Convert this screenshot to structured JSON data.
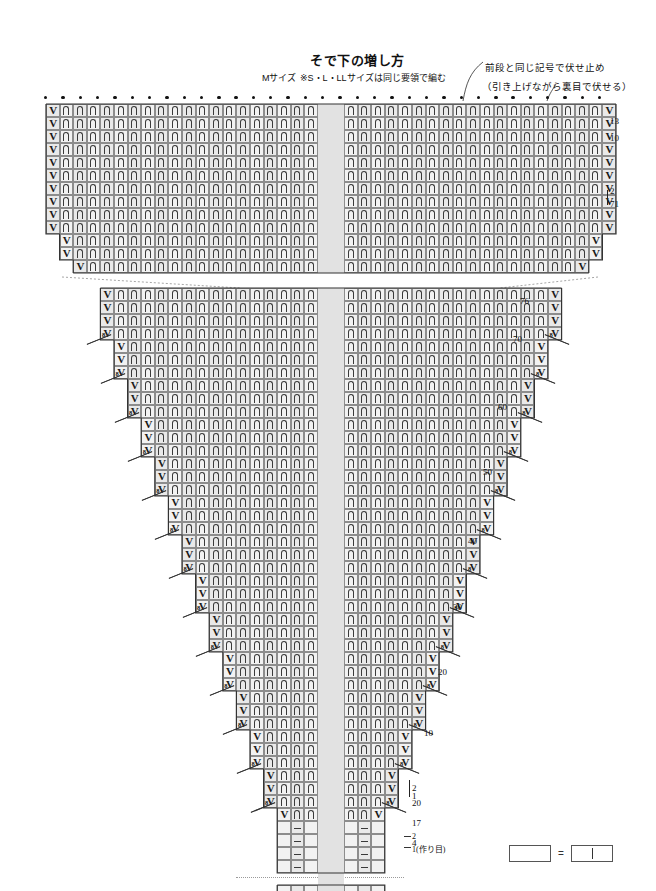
{
  "page": {
    "title": "そで下の増し方",
    "size_label": "Mサイズ",
    "size_note": "※S・L・LLサイズは同じ要領で編む",
    "annotation_1": "前段と同じ記号で伏せ止め",
    "annotation_2": "（引き上げながら裏目で伏せる）"
  },
  "legend": {
    "empty_label": "",
    "equals": "=",
    "knit_label": "",
    "meaning": "空白マス = 表目（knit）"
  },
  "symbols": {
    "increase": "V",
    "twisted_knit": "arch-symbol",
    "purl": "purl-bar",
    "bind_off": "bind-off-dot",
    "every_8_rows": "8"
  },
  "chart_data": {
    "type": "table",
    "top_section": {
      "label": "upper sleeve cap",
      "row_labels": [
        "13",
        "10",
        "2",
        "71"
      ],
      "bind_off_row": true,
      "bind_off_dots": 33
    },
    "bottom_section": {
      "label": "sleeve body tapering to cast-on",
      "row_labels": [
        "76",
        "70",
        "60",
        "50",
        "40",
        "30",
        "20",
        "10",
        "2",
        "1",
        "20",
        "17",
        "4"
      ],
      "cast_on_note": "1(作り目)",
      "cast_on_marks": [
        "2",
        "1"
      ]
    },
    "row_markers": [
      {
        "value": "13",
        "y": 116
      },
      {
        "value": "10",
        "y": 133
      },
      {
        "value": "2",
        "y": 186
      },
      {
        "value": "71",
        "y": 199
      },
      {
        "value": "76",
        "y": 296
      },
      {
        "value": "70",
        "y": 334
      },
      {
        "value": "60",
        "y": 402
      },
      {
        "value": "50",
        "y": 467
      },
      {
        "value": "40",
        "y": 536
      },
      {
        "value": "30",
        "y": 602
      },
      {
        "value": "20",
        "y": 667
      },
      {
        "value": "10",
        "y": 728
      },
      {
        "value": "2",
        "y": 783
      },
      {
        "value": "1",
        "y": 791
      },
      {
        "value": "20",
        "y": 798
      },
      {
        "value": "17",
        "y": 818
      },
      {
        "value": "4",
        "y": 838
      }
    ],
    "increase_interval_markers": [
      "8",
      "8",
      "8",
      "8",
      "8",
      "8",
      "8",
      "8",
      "8",
      "8"
    ],
    "notes": [
      "V = 増し目 (make one / increase)",
      "⌒ = ねじり目 (twisted stitch)",
      "− = 裏目 (purl)",
      "• = 伏せ止め (bind off)"
    ]
  }
}
